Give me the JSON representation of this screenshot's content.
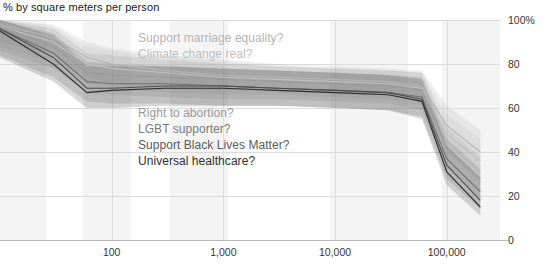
{
  "chart_data": {
    "type": "line",
    "title": "% by square meters per person",
    "xlabel": "",
    "ylabel": "",
    "xscale": "log",
    "xlim": [
      10,
      300000
    ],
    "ylim": [
      0,
      100
    ],
    "grid": true,
    "legend_position": "inline-annotations",
    "y_ticks": [
      "0",
      "20",
      "40",
      "60",
      "80",
      "100%"
    ],
    "y_tick_values": [
      0,
      20,
      40,
      60,
      80,
      100
    ],
    "x_ticks": [
      "100",
      "1,000",
      "10,000",
      "100,000"
    ],
    "x_tick_values": [
      100,
      1000,
      10000,
      100000
    ],
    "x": [
      10,
      30,
      60,
      100,
      300,
      1000,
      3000,
      10000,
      30000,
      60000,
      100000,
      200000
    ],
    "series": [
      {
        "name": "Support marriage equality?",
        "color": "#b4b4b4",
        "values": [
          98,
          92,
          83,
          80,
          77,
          75,
          74,
          73,
          72,
          70,
          52,
          40
        ],
        "band_low": [
          90,
          84,
          74,
          71,
          69,
          68,
          68,
          67,
          66,
          63,
          44,
          30
        ],
        "band_high": [
          100,
          98,
          90,
          87,
          84,
          82,
          80,
          79,
          78,
          77,
          61,
          50
        ]
      },
      {
        "name": "Climate change real?",
        "color": "#bfbfbf",
        "values": [
          97,
          90,
          80,
          78,
          76,
          74,
          73,
          72,
          71,
          69,
          48,
          36
        ],
        "band_low": [
          88,
          81,
          71,
          69,
          67,
          66,
          66,
          65,
          64,
          61,
          40,
          26
        ],
        "band_high": [
          100,
          97,
          88,
          86,
          83,
          81,
          79,
          78,
          77,
          76,
          57,
          46
        ]
      },
      {
        "name": "Right to abortion?",
        "color": "#9a9a9a",
        "values": [
          97,
          88,
          76,
          75,
          74,
          73,
          72,
          71,
          70,
          68,
          42,
          28
        ],
        "band_low": [
          86,
          78,
          67,
          66,
          65,
          64,
          64,
          63,
          62,
          59,
          33,
          19
        ],
        "band_high": [
          100,
          96,
          85,
          84,
          82,
          80,
          79,
          78,
          77,
          76,
          51,
          38
        ]
      },
      {
        "name": "LGBT supporter?",
        "color": "#707070",
        "values": [
          96,
          85,
          72,
          71,
          71,
          70,
          69,
          68,
          67,
          65,
          37,
          22
        ],
        "band_low": [
          84,
          74,
          63,
          62,
          62,
          61,
          61,
          60,
          59,
          56,
          28,
          14
        ],
        "band_high": [
          100,
          94,
          81,
          80,
          79,
          78,
          77,
          76,
          75,
          74,
          46,
          32
        ]
      },
      {
        "name": "Support Black Lives Matter?",
        "color": "#4d4d4d",
        "values": [
          96,
          83,
          69,
          69,
          70,
          70,
          69,
          68,
          67,
          64,
          34,
          18
        ],
        "band_low": [
          83,
          72,
          60,
          60,
          61,
          61,
          61,
          60,
          59,
          55,
          25,
          11
        ],
        "band_high": [
          100,
          93,
          79,
          79,
          79,
          78,
          77,
          76,
          75,
          73,
          43,
          28
        ]
      },
      {
        "name": "Universal healthcare?",
        "color": "#2b2b2b",
        "values": [
          95,
          80,
          67,
          68,
          69,
          69,
          68,
          67,
          66,
          63,
          31,
          15
        ]
      }
    ],
    "annotations": [
      {
        "text": "Support marriage equality?",
        "color": "#b4b4b4",
        "x": 138,
        "y": 31
      },
      {
        "text": "Climate change real?",
        "color": "#bdbdbd",
        "x": 138,
        "y": 47
      },
      {
        "text": "Right to abortion?",
        "color": "#9a9a9a",
        "x": 138,
        "y": 106
      },
      {
        "text": "LGBT supporter?",
        "color": "#7b7b7b",
        "x": 138,
        "y": 122
      },
      {
        "text": "Support Black Lives Matter?",
        "color": "#5a5a5a",
        "x": 138,
        "y": 138
      },
      {
        "text": "Universal healthcare?",
        "color": "#303030",
        "x": 138,
        "y": 154
      }
    ]
  }
}
